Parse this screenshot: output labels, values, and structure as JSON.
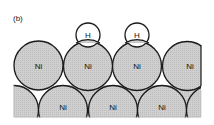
{
  "panel_label": "(b)",
  "colors": {
    "atom_fill": "#cfcfcf",
    "h_fill": "#ffffff",
    "stroke": "#1a1a1a",
    "background": "#ffffff"
  },
  "top_row": {
    "atoms": [
      {
        "label": "Ni",
        "cx": 38.5,
        "cy": 65.5
      },
      {
        "label": "Ni",
        "cx": 88,
        "cy": 66
      },
      {
        "label": "Ni",
        "cx": 137,
        "cy": 66
      },
      {
        "label": "Ni",
        "cx": 187,
        "cy": 66
      }
    ],
    "radius": 24.5
  },
  "adsorbed": {
    "atoms": [
      {
        "label": "H",
        "cx": 88,
        "cy": 36
      },
      {
        "label": "H",
        "cx": 137,
        "cy": 36
      }
    ],
    "radius": 12
  },
  "bottom_row": {
    "labels": [
      {
        "label": "Ni",
        "x": 63,
        "y": 110
      },
      {
        "label": "Ni",
        "x": 113,
        "y": 110
      },
      {
        "label": "Ni",
        "x": 162,
        "y": 110
      }
    ]
  }
}
